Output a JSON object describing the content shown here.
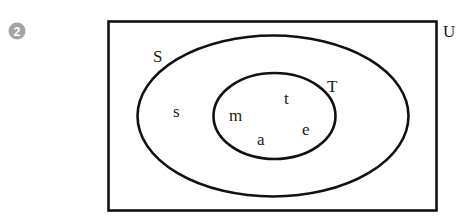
{
  "problem_number": "2",
  "colors": {
    "badge": "#a3a3a3",
    "stroke": "#111111",
    "text": "#1a1a1a"
  },
  "diagram": {
    "type": "venn",
    "universal_set": {
      "label": "U"
    },
    "sets": [
      {
        "name": "S",
        "label": "S",
        "elements_only_in_set": [
          "s"
        ]
      },
      {
        "name": "T",
        "label": "T",
        "subset_of": "S",
        "elements": [
          "m",
          "t",
          "e",
          "a"
        ]
      }
    ],
    "element_labels": {
      "s": "s",
      "m": "m",
      "t": "t",
      "e": "e",
      "a": "a"
    }
  }
}
